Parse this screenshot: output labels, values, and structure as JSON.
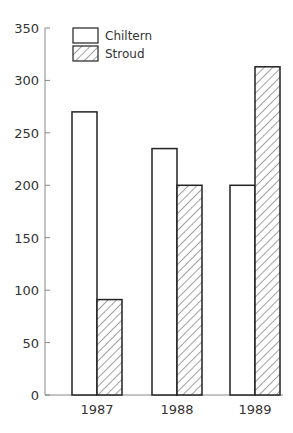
{
  "chart_data": {
    "type": "bar",
    "title": "",
    "xlabel": "",
    "ylabel": "",
    "categories": [
      "1987",
      "1988",
      "1989"
    ],
    "series": [
      {
        "name": "Chiltern",
        "values": [
          270,
          235,
          200
        ],
        "pattern": "none",
        "fill": "#ffffff"
      },
      {
        "name": "Stroud",
        "values": [
          91,
          200,
          313
        ],
        "pattern": "diagonal-hatch",
        "fill": "#ffffff"
      }
    ],
    "ylim": [
      0,
      350
    ],
    "yticks": [
      0,
      50,
      100,
      150,
      200,
      250,
      300,
      350
    ],
    "grid": false,
    "legend_position": "top-left-inside"
  },
  "colors": {
    "stroke": "#222222",
    "axis": "#888888",
    "text": "#333333",
    "background": "#ffffff"
  }
}
